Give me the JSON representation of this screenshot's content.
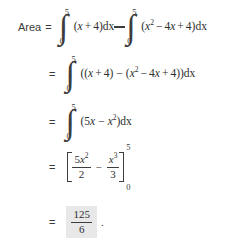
{
  "document": {
    "type": "math-derivation",
    "title": "Area between curves computation",
    "background_color": "#ffffff",
    "text_color": "#2e2e2e",
    "highlight_color": "#e8e8e8"
  },
  "lines": [
    {
      "id": "line-1",
      "label": "Area",
      "equals": "=",
      "integral_1": {
        "upper_limit": "5",
        "lower_limit": "0",
        "glyph": "∫",
        "open_paren": "(",
        "term_var": "x",
        "plus": "+",
        "term_const": "4",
        "close_paren": ")",
        "differential": "dx"
      },
      "operator": "−",
      "integral_2": {
        "upper_limit": "5",
        "lower_limit": "0",
        "glyph": "∫",
        "open_paren": "(",
        "var_sq": "x",
        "exp_2": "2",
        "minus": "−",
        "coeff_4": "4",
        "var_x": "x",
        "plus": "+",
        "const_4": "4",
        "close_paren": ")",
        "differential": "dx"
      }
    },
    {
      "id": "line-2",
      "equals": "=",
      "integral": {
        "upper_limit": "5",
        "lower_limit": "0",
        "glyph": "∫",
        "body_open": "((",
        "var_x": "x",
        "plus_1": "+",
        "const_4a": "4",
        "close_1": ")",
        "minus": "−",
        "open_2": "(",
        "var_sq": "x",
        "exp_2": "2",
        "minus_2": "−",
        "coeff_4": "4",
        "var_x2": "x",
        "plus_2": "+",
        "const_4b": "4",
        "close_2": "))",
        "differential": "dx"
      }
    },
    {
      "id": "line-3",
      "equals": "=",
      "integral": {
        "upper_limit": "5",
        "lower_limit": "0",
        "glyph": "∫",
        "open_paren": "(",
        "coeff_5": "5",
        "var_x": "x",
        "minus": "−",
        "var_sq": "x",
        "exp_2": "2",
        "close_paren": ")",
        "differential": "dx"
      }
    },
    {
      "id": "line-4",
      "equals": "=",
      "bracket": {
        "upper_limit": "5",
        "lower_limit": "0",
        "term_1": {
          "numerator_coeff": "5",
          "numerator_var": "x",
          "numerator_exp": "2",
          "denominator": "2"
        },
        "operator": "−",
        "term_2": {
          "numerator_var": "x",
          "numerator_exp": "3",
          "denominator": "3"
        }
      }
    },
    {
      "id": "line-5",
      "equals": "=",
      "result": {
        "numerator": "125",
        "denominator": "6",
        "highlighted": true
      },
      "period": "."
    }
  ]
}
